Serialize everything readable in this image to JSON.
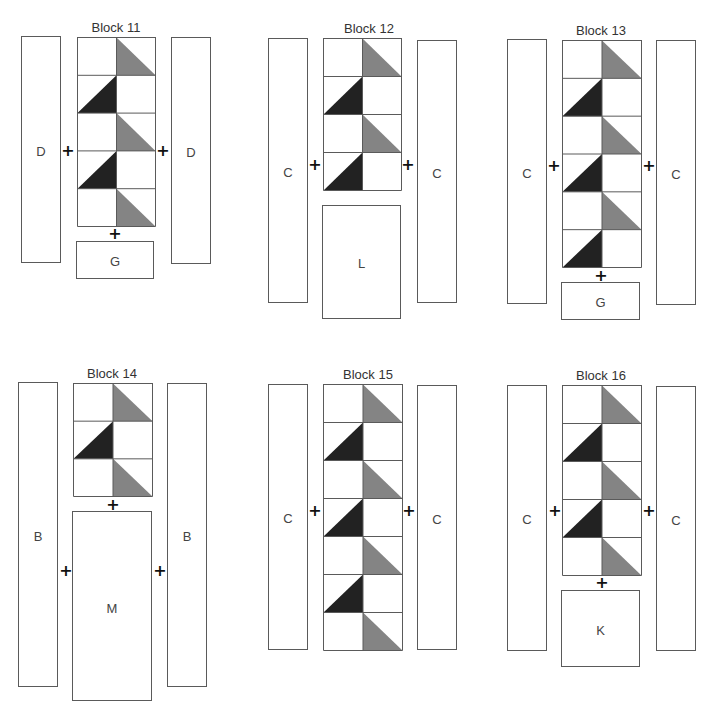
{
  "colors": {
    "gray_triangle": "#848484",
    "dark_triangle": "#222222",
    "outline": "#5a5a5a"
  },
  "blocks": [
    {
      "title": "Block 11",
      "title_pos": [
        116,
        20
      ],
      "left_strip": {
        "label": "D",
        "box": [
          21,
          36,
          40,
          227
        ]
      },
      "right_strip": {
        "label": "D",
        "box": [
          171,
          37,
          40,
          227
        ]
      },
      "grid": {
        "box": [
          77,
          37,
          78,
          189
        ],
        "rows": 5
      },
      "plus": [
        [
          68,
          151
        ],
        [
          163,
          151
        ],
        [
          115,
          234
        ]
      ],
      "bottom_piece": {
        "label": "G",
        "box": [
          76,
          241,
          78,
          38
        ]
      }
    },
    {
      "title": "Block 12",
      "title_pos": [
        369,
        21
      ],
      "left_strip": {
        "label": "C",
        "box": [
          268,
          38,
          40,
          265
        ]
      },
      "right_strip": {
        "label": "C",
        "box": [
          417,
          40,
          40,
          263
        ]
      },
      "grid": {
        "box": [
          323,
          38,
          78,
          152
        ],
        "rows": 4
      },
      "plus": [
        [
          315,
          165
        ],
        [
          408,
          165
        ]
      ],
      "bottom_piece": {
        "label": "L",
        "box": [
          322,
          205,
          79,
          114
        ]
      }
    },
    {
      "title": "Block 13",
      "title_pos": [
        601,
        23
      ],
      "left_strip": {
        "label": "C",
        "box": [
          507,
          39,
          40,
          265
        ]
      },
      "right_strip": {
        "label": "C",
        "box": [
          656,
          40,
          40,
          265
        ]
      },
      "grid": {
        "box": [
          562,
          40,
          79,
          227
        ],
        "rows": 6
      },
      "plus": [
        [
          554,
          166
        ],
        [
          649,
          166
        ],
        [
          601,
          276
        ]
      ],
      "bottom_piece": {
        "label": "G",
        "box": [
          561,
          282,
          79,
          38
        ]
      }
    },
    {
      "title": "Block 14",
      "title_pos": [
        112,
        366
      ],
      "left_strip": {
        "label": "B",
        "box": [
          18,
          382,
          40,
          305
        ],
        "label_y": 153
      },
      "right_strip": {
        "label": "B",
        "box": [
          167,
          383,
          40,
          304
        ],
        "label_y": 152
      },
      "grid": {
        "box": [
          73,
          383,
          79,
          113
        ],
        "rows": 3
      },
      "plus": [
        [
          66,
          571
        ],
        [
          160,
          571
        ],
        [
          113,
          505
        ]
      ],
      "bottom_piece": {
        "label": "M",
        "box": [
          72,
          511,
          80,
          190
        ],
        "label_y": 96
      }
    },
    {
      "title": "Block 15",
      "title_pos": [
        368,
        367
      ],
      "left_strip": {
        "label": "C",
        "box": [
          268,
          384,
          40,
          266
        ]
      },
      "right_strip": {
        "label": "C",
        "box": [
          417,
          385,
          40,
          265
        ]
      },
      "grid": {
        "box": [
          323,
          384,
          79,
          266
        ],
        "rows": 7
      },
      "plus": [
        [
          315,
          511
        ],
        [
          409,
          511
        ]
      ],
      "bottom_piece": null
    },
    {
      "title": "Block 16",
      "title_pos": [
        601,
        368
      ],
      "left_strip": {
        "label": "C",
        "box": [
          507,
          385,
          40,
          266
        ]
      },
      "right_strip": {
        "label": "C",
        "box": [
          656,
          386,
          40,
          265
        ]
      },
      "grid": {
        "box": [
          562,
          385,
          79,
          190
        ],
        "rows": 5
      },
      "plus": [
        [
          555,
          511
        ],
        [
          649,
          511
        ],
        [
          602,
          583
        ]
      ],
      "bottom_piece": {
        "label": "K",
        "box": [
          561,
          590,
          79,
          77
        ]
      }
    }
  ],
  "plus_symbol": "+"
}
